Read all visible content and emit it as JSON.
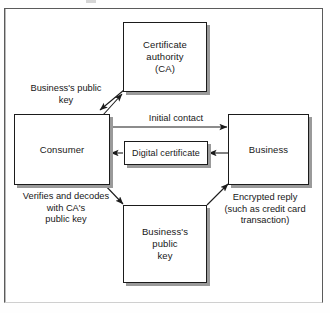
{
  "figure": {
    "type": "flow-diagram",
    "title": "",
    "frame": {
      "visible": true,
      "border_color": "#5a5a5a"
    },
    "background_color": "#ffffff",
    "box_border_color": "#1b1b1b",
    "box_shadow_color": "#9a9a9a"
  },
  "nodes": {
    "certificate_authority": {
      "label": "Certificate\nauthority\n(CA)"
    },
    "consumer": {
      "label": "Consumer"
    },
    "business": {
      "label": "Business"
    },
    "digital_certificate": {
      "label": "Digital certificate"
    },
    "business_public_key": {
      "label": "Business's\npublic\nkey"
    }
  },
  "annotations": {
    "business_public_key_left": "Business's public\nkey",
    "initial_contact": "Initial contact",
    "verifies_and_decodes": "Verifies and decodes\nwith CA's\npublic key",
    "encrypted_reply": "Encrypted reply\n(such as credit card\ntransaction)"
  },
  "edges": [
    {
      "name": "consumer-to-ca",
      "from": "consumer",
      "to": "certificate_authority",
      "direction": "up-right",
      "label": ""
    },
    {
      "name": "ca-to-consumer",
      "from": "certificate_authority",
      "to": "consumer",
      "direction": "down-left",
      "label": "Business's public key"
    },
    {
      "name": "consumer-to-business",
      "from": "consumer",
      "to": "business",
      "direction": "right",
      "label": "Initial contact"
    },
    {
      "name": "business-to-digital-certificate",
      "from": "business",
      "to": "digital_certificate",
      "direction": "left",
      "label": ""
    },
    {
      "name": "digital-certificate-to-consumer",
      "from": "digital_certificate",
      "to": "consumer",
      "direction": "left",
      "label": ""
    },
    {
      "name": "consumer-to-business-public-key",
      "from": "consumer",
      "to": "business_public_key",
      "direction": "down-right",
      "label": "Verifies and decodes with CA's public key"
    },
    {
      "name": "business-public-key-to-business",
      "from": "business_public_key",
      "to": "business",
      "direction": "up-right",
      "label": "Encrypted reply (such as credit card transaction)"
    }
  ]
}
